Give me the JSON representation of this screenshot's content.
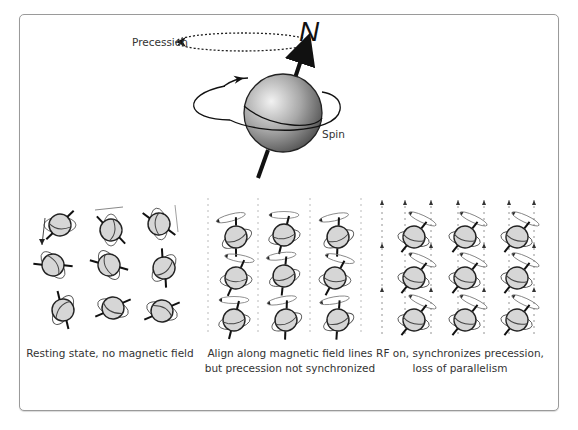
{
  "figure": {
    "top_diagram": {
      "precession_label": "Precession",
      "spin_label": "Spin",
      "pole_label": "N"
    },
    "panels": [
      {
        "id": "resting",
        "caption_lines": [
          "Resting state, no magnetic field"
        ],
        "field_lines": false,
        "aligned": false
      },
      {
        "id": "aligned",
        "caption_lines": [
          "Align along magnetic field lines",
          "but precession not synchronized"
        ],
        "field_lines": true,
        "aligned": true
      },
      {
        "id": "rf-on",
        "caption_lines": [
          "RF on, synchronizes precession,",
          "loss of parallelism"
        ],
        "field_lines": true,
        "aligned": true
      }
    ],
    "colors": {
      "border": "#9a9a9a",
      "sphere_fill": "#d6d6d6",
      "stroke": "#222222",
      "field_line": "#999999"
    }
  }
}
